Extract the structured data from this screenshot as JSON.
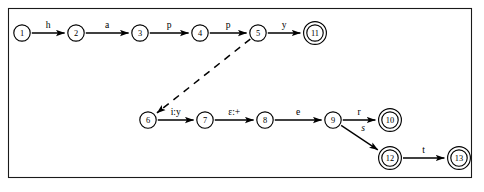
{
  "diagram": {
    "type": "state-transition-diagram",
    "frame": {
      "x": 8,
      "y": 8,
      "width": 464,
      "height": 170
    },
    "colors": {
      "background": "#ffffff",
      "stroke": "#000000",
      "frame": "#1a1a1a"
    },
    "states": [
      {
        "id": "1",
        "label": "1",
        "x": 22,
        "y": 33,
        "accepting": false
      },
      {
        "id": "2",
        "label": "2",
        "x": 76,
        "y": 33,
        "accepting": false
      },
      {
        "id": "3",
        "label": "3",
        "x": 140,
        "y": 33,
        "accepting": false
      },
      {
        "id": "4",
        "label": "4",
        "x": 200,
        "y": 33,
        "accepting": false
      },
      {
        "id": "5",
        "label": "5",
        "x": 258,
        "y": 33,
        "accepting": false
      },
      {
        "id": "11",
        "label": "11",
        "x": 315,
        "y": 33,
        "accepting": true
      },
      {
        "id": "6",
        "label": "6",
        "x": 148,
        "y": 120,
        "accepting": false
      },
      {
        "id": "7",
        "label": "7",
        "x": 205,
        "y": 120,
        "accepting": false
      },
      {
        "id": "8",
        "label": "8",
        "x": 265,
        "y": 120,
        "accepting": false
      },
      {
        "id": "9",
        "label": "9",
        "x": 333,
        "y": 120,
        "accepting": false
      },
      {
        "id": "10",
        "label": "10",
        "x": 390,
        "y": 120,
        "accepting": true
      },
      {
        "id": "12",
        "label": "12",
        "x": 390,
        "y": 158,
        "accepting": true
      },
      {
        "id": "13",
        "label": "13",
        "x": 459,
        "y": 158,
        "accepting": true
      }
    ],
    "transitions": [
      {
        "from": "1",
        "to": "2",
        "label": "h",
        "style": "solid",
        "italic": false
      },
      {
        "from": "2",
        "to": "3",
        "label": "a",
        "style": "solid",
        "italic": false
      },
      {
        "from": "3",
        "to": "4",
        "label": "p",
        "style": "solid",
        "italic": false
      },
      {
        "from": "4",
        "to": "5",
        "label": "p",
        "style": "solid",
        "italic": false
      },
      {
        "from": "5",
        "to": "11",
        "label": "y",
        "style": "solid",
        "italic": false
      },
      {
        "from": "5",
        "to": "6",
        "label": "",
        "style": "dashed",
        "italic": false
      },
      {
        "from": "6",
        "to": "7",
        "label": "i:y",
        "style": "solid",
        "italic": false
      },
      {
        "from": "7",
        "to": "8",
        "label": "ε:+",
        "style": "solid",
        "italic": false
      },
      {
        "from": "8",
        "to": "9",
        "label": "e",
        "style": "solid",
        "italic": false
      },
      {
        "from": "9",
        "to": "10",
        "label": "r",
        "style": "solid",
        "italic": false
      },
      {
        "from": "9",
        "to": "12",
        "label": "s",
        "style": "solid",
        "italic": true
      },
      {
        "from": "12",
        "to": "13",
        "label": "t",
        "style": "solid",
        "italic": false
      }
    ]
  }
}
